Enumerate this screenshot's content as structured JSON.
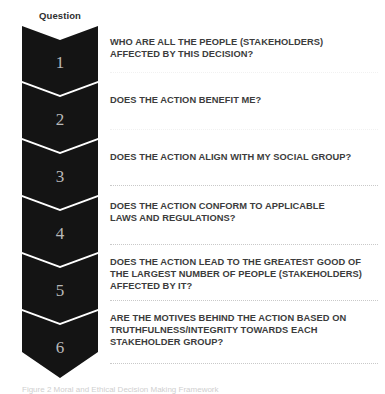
{
  "figure": {
    "header_label": "Question",
    "background_color": "#ffffff",
    "chevron_color": "#141414",
    "number_color": "#b9b9b9",
    "text_color": "#3c3c3c",
    "separator_color": "#c9c9c9",
    "bottom_caption": "Figure 2 Moral and Ethical Decision Making Framework"
  },
  "steps": [
    {
      "number": "1",
      "question": "Who are all the people (stakeholders) affected by this decision?",
      "lines": [
        "WHO ARE ALL THE PEOPLE (STAKEHOLDERS)",
        "AFFECTED BY THIS DECISION?"
      ]
    },
    {
      "number": "2",
      "question": "Does the action benefit me?",
      "lines": [
        "DOES THE ACTION BENEFIT ME?"
      ]
    },
    {
      "number": "3",
      "question": "Does the action align with my social group?",
      "lines": [
        "DOES THE ACTION ALIGN WITH MY SOCIAL GROUP?"
      ]
    },
    {
      "number": "4",
      "question": "Does the action conform to applicable laws and regulations?",
      "lines": [
        "DOES THE ACTION CONFORM TO APPLICABLE",
        "LAWS AND REGULATIONS?"
      ]
    },
    {
      "number": "5",
      "question": "Does the action lead to the greatest good of the largest number of people (stakeholders) affected by it?",
      "lines": [
        "DOES THE ACTION LEAD TO THE GREATEST GOOD OF",
        "THE LARGEST NUMBER OF PEOPLE (STAKEHOLDERS)",
        "AFFECTED BY IT?"
      ]
    },
    {
      "number": "6",
      "question": "Are the motives behind the action based on truthfulness/integrity towards each stakeholder group?",
      "lines": [
        "ARE THE MOTIVES BEHIND THE ACTION BASED ON",
        "TRUTHFULNESS/INTEGRITY TOWARDS EACH",
        "STAKEHOLDER GROUP?"
      ]
    }
  ]
}
